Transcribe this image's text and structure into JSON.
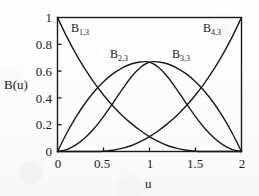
{
  "figure": {
    "background_color": "#fdfdfd",
    "ink_color": "#1a1a1a"
  },
  "axes": {
    "xlabel": "u",
    "ylabel": "B(u)",
    "x_ticks": [
      "0",
      "0.5",
      "1",
      "1.5",
      "2"
    ],
    "y_ticks": [
      "0",
      "0.2",
      "0.4",
      "0.6",
      "0.8",
      "1"
    ]
  },
  "curve_labels": [
    {
      "base": "B",
      "sub": "1,3"
    },
    {
      "base": "B",
      "sub": "2,3"
    },
    {
      "base": "B",
      "sub": "3,3"
    },
    {
      "base": "B",
      "sub": "4,3"
    }
  ],
  "chart_data": {
    "type": "line",
    "title": "",
    "xlabel": "u",
    "ylabel": "B(u)",
    "xlim": [
      0,
      2
    ],
    "ylim": [
      0,
      1
    ],
    "xticks": [
      0,
      0.5,
      1,
      1.5,
      2
    ],
    "yticks": [
      0,
      0.2,
      0.4,
      0.6,
      0.8,
      1
    ],
    "grid": false,
    "legend": "inline-annotations",
    "annotations": [
      {
        "text": "B1,3",
        "x": 0.22,
        "y": 0.9
      },
      {
        "text": "B2,3",
        "x": 0.62,
        "y": 0.78
      },
      {
        "text": "B3,3",
        "x": 1.3,
        "y": 0.78
      },
      {
        "text": "B4,3",
        "x": 1.78,
        "y": 0.92
      }
    ],
    "series": [
      {
        "name": "B1,3",
        "color": "#1a1a1a",
        "x": [
          0,
          0.1,
          0.2,
          0.3,
          0.4,
          0.5,
          0.6,
          0.7,
          0.8,
          0.9,
          1.0,
          1.1,
          1.2,
          1.3,
          1.4,
          1.5,
          1.6,
          1.7,
          1.8,
          1.9,
          2.0
        ],
        "values": [
          1.0,
          0.857,
          0.729,
          0.614,
          0.512,
          0.422,
          0.341,
          0.271,
          0.21,
          0.157,
          0.111,
          0.073,
          0.043,
          0.023,
          0.009,
          0.002,
          0.0,
          0.0,
          0.0,
          0.0,
          0.0
        ]
      },
      {
        "name": "B2,3",
        "color": "#1a1a1a",
        "x": [
          0,
          0.1,
          0.2,
          0.3,
          0.4,
          0.5,
          0.6,
          0.7,
          0.8,
          0.9,
          1.0,
          1.1,
          1.2,
          1.3,
          1.4,
          1.5,
          1.6,
          1.7,
          1.8,
          1.9,
          2.0
        ],
        "values": [
          0.0,
          0.136,
          0.256,
          0.36,
          0.448,
          0.521,
          0.579,
          0.623,
          0.653,
          0.668,
          0.667,
          0.627,
          0.554,
          0.46,
          0.358,
          0.26,
          0.173,
          0.102,
          0.049,
          0.014,
          0.0
        ]
      },
      {
        "name": "B3,3",
        "color": "#1a1a1a",
        "x": [
          0,
          0.1,
          0.2,
          0.3,
          0.4,
          0.5,
          0.6,
          0.7,
          0.8,
          0.9,
          1.0,
          1.1,
          1.2,
          1.3,
          1.4,
          1.5,
          1.6,
          1.7,
          1.8,
          1.9,
          2.0
        ],
        "values": [
          0.0,
          0.014,
          0.049,
          0.102,
          0.173,
          0.26,
          0.358,
          0.46,
          0.554,
          0.627,
          0.667,
          0.668,
          0.653,
          0.623,
          0.579,
          0.521,
          0.448,
          0.36,
          0.256,
          0.136,
          0.0
        ]
      },
      {
        "name": "B4,3",
        "color": "#1a1a1a",
        "x": [
          0,
          0.1,
          0.2,
          0.3,
          0.4,
          0.5,
          0.6,
          0.7,
          0.8,
          0.9,
          1.0,
          1.1,
          1.2,
          1.3,
          1.4,
          1.5,
          1.6,
          1.7,
          1.8,
          1.9,
          2.0
        ],
        "values": [
          0.0,
          0.0,
          0.0,
          0.0,
          0.0,
          0.002,
          0.009,
          0.023,
          0.043,
          0.073,
          0.111,
          0.157,
          0.21,
          0.271,
          0.341,
          0.422,
          0.512,
          0.614,
          0.729,
          0.857,
          1.0
        ]
      }
    ]
  }
}
